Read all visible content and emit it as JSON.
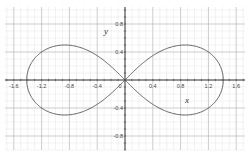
{
  "chart_data": {
    "type": "line",
    "title": "",
    "curve": "lemniscate of Bernoulli",
    "equation": "(x^2 + y^2)^2 = 2(x^2 - y^2)",
    "xlabel": "x",
    "ylabel": "y",
    "xlim": [
      -1.72,
      1.72
    ],
    "ylim": [
      -1.0,
      1.05
    ],
    "grid": true,
    "major_step": 0.4,
    "minor_step": 0.1,
    "x_ticks": [
      -1.6,
      -1.2,
      -0.8,
      -0.4,
      0.4,
      0.8,
      1.2,
      1.6
    ],
    "x_tick_labels": [
      "-1.6",
      "-1.2",
      "-0.8",
      "-0.4",
      "0.4",
      "0.8",
      "1.2",
      "1.6"
    ],
    "y_ticks": [
      0.8,
      0.4,
      -0.4,
      -0.8
    ],
    "y_tick_labels": [
      "0.8",
      "0.4",
      "-0.4",
      "-0.8"
    ],
    "origin_label": "0",
    "series": [
      {
        "name": "lemniscate",
        "color": "#555555",
        "key_points": [
          {
            "x": 1.414,
            "y": 0
          },
          {
            "x": 0.866,
            "y": 0.5
          },
          {
            "x": 0,
            "y": 0
          },
          {
            "x": -0.866,
            "y": 0.5
          },
          {
            "x": -1.414,
            "y": 0
          },
          {
            "x": -0.866,
            "y": -0.5
          },
          {
            "x": 0.866,
            "y": -0.5
          }
        ]
      }
    ]
  },
  "colors": {
    "background": "#ffffff",
    "minor_grid": "#e4e4e4",
    "major_grid": "#b8b8b8",
    "axis": "#333333",
    "curve": "#555555"
  }
}
